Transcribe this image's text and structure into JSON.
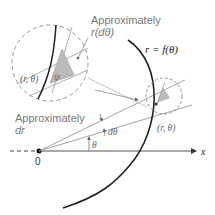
{
  "diagram": {
    "labels": {
      "approx_rdtheta_line1": "Approximately",
      "approx_rdtheta_line2": "r(dθ)",
      "approx_dr_line1": "Approximately",
      "approx_dr_line2": "dr",
      "curve": "r = f(θ)",
      "point_zoomed": "(r, θ)",
      "point_small": "(r, θ)",
      "psi": "ψ",
      "theta": "θ",
      "dtheta": "dθ",
      "origin": "0",
      "x_axis": "x"
    },
    "colors": {
      "curve": "#222222",
      "rays": "#888888",
      "dashed_circles": "#888888",
      "shaded_triangle": "#bbbbbb",
      "text": "#777777"
    }
  }
}
